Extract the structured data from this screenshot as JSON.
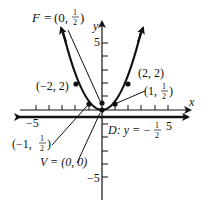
{
  "diagram": {
    "axes": {
      "x_label": "x",
      "y_label": "y",
      "x_tick_labels": [
        "-5",
        "5"
      ],
      "y_tick_labels": [
        "5",
        "-5"
      ]
    },
    "curve": {
      "equation": "y = x^2/2",
      "color": "#111111"
    },
    "points": [
      {
        "name": "focus",
        "label": "F = (0, 1/2)",
        "lhs": "F = ",
        "x": 0,
        "y": 0.5,
        "num": "1",
        "den": "2"
      },
      {
        "name": "vertex",
        "label": "V = (0, 0)",
        "x": 0,
        "y": 0
      },
      {
        "name": "point-left-2",
        "label": "(−2, 2)",
        "x": -2,
        "y": 2
      },
      {
        "name": "point-right-2",
        "label": "(2, 2)",
        "x": 2,
        "y": 2
      },
      {
        "name": "point-left-1",
        "label": "(−1, 1/2)",
        "x": -1,
        "y": 0.5
      },
      {
        "name": "point-right-1",
        "label": "(1, 1/2)",
        "x": 1,
        "y": 0.5
      }
    ],
    "directrix": {
      "label_prefix": "D: y = −",
      "num": "1",
      "den": "2",
      "y": -0.5
    },
    "text": {
      "F_lhs": "F = ",
      "F_open": "(0, ",
      "F_close": ")",
      "half_num": "1",
      "half_den": "2",
      "V": "V = (0, 0)",
      "pm2": "(−2, 2)",
      "pp2": "(2, 2)",
      "pm1_open": "(−1, ",
      "pp1_open": "(1, ",
      "close": ")",
      "D": "D: y = −",
      "x": "x",
      "y": "y",
      "five": "5",
      "neg_five": "−5"
    }
  }
}
